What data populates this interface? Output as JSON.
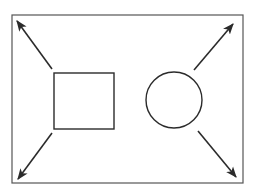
{
  "diagram": {
    "colors": {
      "stroke": "#2b2b2b",
      "frame": "#555555",
      "background": "#ffffff"
    },
    "frame": {
      "x": 12,
      "y": 15,
      "width": 231,
      "height": 168
    },
    "shapes": [
      {
        "type": "square",
        "x": 54,
        "y": 73,
        "width": 60,
        "height": 56
      },
      {
        "type": "circle",
        "cx": 174,
        "cy": 100,
        "r": 28
      }
    ],
    "arrows": [
      {
        "name": "arrow-top-left",
        "x1": 52,
        "y1": 69,
        "x2": 17,
        "y2": 21
      },
      {
        "name": "arrow-top-right",
        "x1": 194,
        "y1": 70,
        "x2": 233,
        "y2": 24
      },
      {
        "name": "arrow-bottom-left",
        "x1": 52,
        "y1": 133,
        "x2": 18,
        "y2": 179
      },
      {
        "name": "arrow-bottom-right",
        "x1": 198,
        "y1": 131,
        "x2": 236,
        "y2": 177
      }
    ]
  }
}
